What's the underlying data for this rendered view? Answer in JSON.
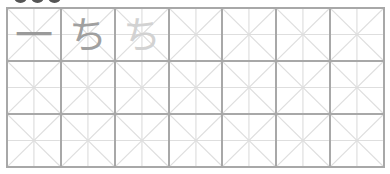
{
  "worksheet": {
    "grid": {
      "columns": 7,
      "rows": 3,
      "border_color": "#a8a8a8",
      "guide_color": "#dedede"
    },
    "practice_cells": [
      {
        "char": "一",
        "color": "#9a9a9a",
        "label": "first stroke"
      },
      {
        "char": "ち",
        "color": "#a0a0a0",
        "label": "model character"
      },
      {
        "char": "ち",
        "color": "#d2d2d2",
        "label": "trace character"
      }
    ]
  }
}
